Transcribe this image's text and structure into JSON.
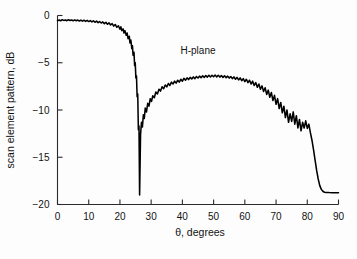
{
  "chart_data": {
    "type": "line",
    "title": "",
    "xlabel": "θ, degrees",
    "ylabel": "scan element pattern, dB",
    "xlim": [
      0,
      90
    ],
    "ylim": [
      -20,
      0
    ],
    "grid": false,
    "legend_position": "none",
    "annotations": [
      {
        "text": "H-plane",
        "x": 45,
        "y": -4.1
      }
    ],
    "xticks": [
      0,
      10,
      20,
      30,
      40,
      50,
      60,
      70,
      80,
      90
    ],
    "xtick_labels": [
      "0",
      "10",
      "20",
      "30",
      "40",
      "50",
      "60",
      "70",
      "80",
      "90"
    ],
    "yticks": [
      0,
      -5,
      -10,
      -15,
      -20
    ],
    "ytick_labels": [
      "0",
      "−5",
      "−10",
      "−15",
      "−20"
    ],
    "series": [
      {
        "name": "H-plane",
        "color": "#000000",
        "x": [
          0.0,
          0.5,
          1.0,
          1.5,
          2.0,
          2.5,
          3.0,
          3.5,
          4.0,
          4.5,
          5.0,
          5.5,
          6.0,
          6.5,
          7.0,
          7.5,
          8.0,
          8.5,
          9.0,
          9.5,
          10.0,
          10.5,
          11.0,
          11.5,
          12.0,
          12.5,
          13.0,
          13.5,
          14.0,
          14.5,
          15.0,
          15.5,
          16.0,
          16.5,
          17.0,
          17.5,
          18.0,
          18.5,
          19.0,
          19.5,
          20.0,
          20.3,
          20.6,
          21.0,
          21.3,
          21.6,
          22.0,
          22.3,
          22.6,
          23.0,
          23.2,
          23.5,
          23.8,
          24.0,
          24.2,
          24.5,
          24.7,
          24.9,
          25.1,
          25.3,
          25.5,
          25.7,
          25.9,
          26.1,
          26.3,
          26.6,
          26.9,
          27.2,
          27.5,
          27.8,
          28.1,
          28.5,
          28.9,
          29.3,
          29.7,
          30.1,
          30.5,
          31.0,
          31.5,
          32.0,
          32.5,
          33.0,
          33.5,
          34.0,
          34.5,
          35.0,
          35.5,
          36.0,
          36.5,
          37.0,
          37.5,
          38.0,
          38.5,
          39.0,
          39.5,
          40.0,
          40.5,
          41.0,
          41.5,
          42.0,
          42.5,
          43.0,
          43.5,
          44.0,
          44.5,
          45.0,
          45.5,
          46.0,
          46.5,
          47.0,
          47.5,
          48.0,
          48.5,
          49.0,
          49.5,
          50.0,
          50.5,
          51.0,
          51.5,
          52.0,
          52.5,
          53.0,
          53.5,
          54.0,
          54.5,
          55.0,
          55.5,
          56.0,
          56.5,
          57.0,
          57.5,
          58.0,
          58.5,
          59.0,
          59.5,
          60.0,
          60.5,
          61.0,
          61.5,
          62.0,
          62.5,
          63.0,
          63.5,
          64.0,
          64.5,
          65.0,
          65.5,
          66.0,
          66.5,
          67.0,
          67.5,
          68.0,
          68.5,
          69.0,
          69.5,
          70.0,
          70.5,
          71.0,
          71.5,
          72.0,
          72.5,
          73.0,
          73.5,
          74.0,
          74.5,
          75.0,
          75.5,
          76.0,
          76.5,
          77.0,
          77.5,
          78.0,
          78.5,
          79.0,
          79.5,
          80.0,
          80.5,
          81.0,
          81.5,
          82.0,
          82.5,
          83.0,
          83.5,
          84.0,
          84.5,
          85.0,
          85.5,
          86.0,
          87.0,
          88.0,
          89.0,
          90.0
        ],
        "y": [
          -0.55,
          -0.48,
          -0.56,
          -0.45,
          -0.52,
          -0.47,
          -0.55,
          -0.44,
          -0.53,
          -0.47,
          -0.56,
          -0.46,
          -0.55,
          -0.48,
          -0.58,
          -0.49,
          -0.6,
          -0.5,
          -0.62,
          -0.52,
          -0.64,
          -0.54,
          -0.68,
          -0.56,
          -0.72,
          -0.6,
          -0.76,
          -0.64,
          -0.8,
          -0.68,
          -0.86,
          -0.72,
          -0.93,
          -0.78,
          -1.0,
          -0.86,
          -1.12,
          -0.95,
          -1.25,
          -1.08,
          -1.45,
          -1.2,
          -1.6,
          -1.42,
          -1.85,
          -1.6,
          -2.1,
          -1.85,
          -2.45,
          -2.2,
          -2.9,
          -2.6,
          -3.5,
          -3.2,
          -4.2,
          -3.9,
          -5.3,
          -5.0,
          -6.6,
          -6.4,
          -8.6,
          -8.3,
          -12.1,
          -11.7,
          -19.0,
          -12.6,
          -11.3,
          -11.8,
          -10.5,
          -10.9,
          -9.8,
          -10.2,
          -9.3,
          -9.6,
          -8.8,
          -9.1,
          -8.5,
          -8.7,
          -8.1,
          -8.3,
          -7.8,
          -8.0,
          -7.55,
          -7.75,
          -7.35,
          -7.55,
          -7.2,
          -7.4,
          -7.05,
          -7.25,
          -6.95,
          -7.15,
          -6.85,
          -7.05,
          -6.75,
          -6.95,
          -6.65,
          -6.85,
          -6.6,
          -6.78,
          -6.55,
          -6.72,
          -6.5,
          -6.68,
          -6.45,
          -6.62,
          -6.42,
          -6.58,
          -6.38,
          -6.55,
          -6.35,
          -6.52,
          -6.33,
          -6.5,
          -6.32,
          -6.48,
          -6.3,
          -6.5,
          -6.32,
          -6.52,
          -6.35,
          -6.55,
          -6.38,
          -6.58,
          -6.42,
          -6.62,
          -6.45,
          -6.68,
          -6.5,
          -6.75,
          -6.55,
          -6.82,
          -6.6,
          -6.9,
          -6.68,
          -7.0,
          -6.75,
          -7.1,
          -6.85,
          -7.25,
          -6.95,
          -7.4,
          -7.1,
          -7.6,
          -7.25,
          -7.8,
          -7.45,
          -8.05,
          -7.65,
          -8.35,
          -7.9,
          -8.65,
          -8.15,
          -9.0,
          -8.45,
          -9.4,
          -8.8,
          -9.85,
          -9.2,
          -10.3,
          -9.6,
          -10.8,
          -10.0,
          -11.3,
          -10.4,
          -11.2,
          -10.2,
          -11.5,
          -10.6,
          -11.9,
          -11.0,
          -12.2,
          -11.3,
          -11.9,
          -11.15,
          -11.95,
          -11.5,
          -12.4,
          -13.2,
          -14.2,
          -15.3,
          -16.4,
          -17.3,
          -18.0,
          -18.4,
          -18.6,
          -18.7,
          -18.72,
          -18.74,
          -18.75,
          -18.75,
          -18.75
        ]
      }
    ]
  },
  "figure": {
    "background": "#fdfdfd",
    "curve_color": "#000000",
    "axis_color": "#2b2b2b"
  }
}
